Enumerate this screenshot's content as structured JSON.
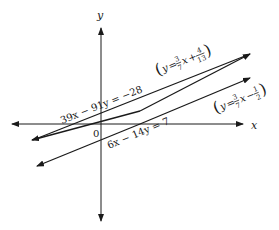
{
  "axes": {
    "x_label": "x",
    "y_label": "y",
    "origin_label": "0"
  },
  "lines": [
    {
      "id": "upper",
      "equation": "39x − 91y = −28",
      "slope_intercept": {
        "lhs": "y",
        "eq": "=",
        "coef_num": "3",
        "coef_den": "7",
        "var": "x",
        "op": "+",
        "const_num": "4",
        "const_den": "13"
      }
    },
    {
      "id": "lower",
      "equation": "6x − 14y = 7",
      "slope_intercept": {
        "lhs": "y",
        "eq": "=",
        "coef_num": "3",
        "coef_den": "7",
        "var": "x",
        "op": "−",
        "const_num": "1",
        "const_den": "2"
      }
    }
  ],
  "colors": {
    "ink": "#1a1a1a",
    "background": "#ffffff"
  }
}
